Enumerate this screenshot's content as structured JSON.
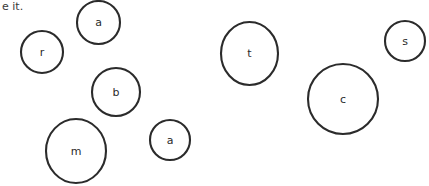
{
  "canvas": {
    "width": 429,
    "height": 186,
    "background": "#ffffff",
    "ink_color": "#2b2b2b",
    "text_color": "#3a3a3a"
  },
  "clipped_text": {
    "content": "e it.",
    "x": 2,
    "y": 2,
    "note": "partial line of text clipped by the left edge of the frame"
  },
  "bubbles": [
    {
      "id": "bubble-a-top",
      "label": "a",
      "cx": 98.5,
      "cy": 22.5,
      "rx": 21.5,
      "ry": 21.5
    },
    {
      "id": "bubble-r",
      "label": "r",
      "cx": 42,
      "cy": 52,
      "rx": 21,
      "ry": 21
    },
    {
      "id": "bubble-t",
      "label": "t",
      "cx": 249.5,
      "cy": 53.5,
      "rx": 28.5,
      "ry": 31.5
    },
    {
      "id": "bubble-s",
      "label": "s",
      "cx": 405,
      "cy": 41,
      "rx": 20,
      "ry": 20
    },
    {
      "id": "bubble-b",
      "label": "b",
      "cx": 116,
      "cy": 92,
      "rx": 24,
      "ry": 24
    },
    {
      "id": "bubble-c",
      "label": "c",
      "cx": 343,
      "cy": 99,
      "rx": 35,
      "ry": 35
    },
    {
      "id": "bubble-a-bottom",
      "label": "a",
      "cx": 170,
      "cy": 140,
      "rx": 20,
      "ry": 20
    },
    {
      "id": "bubble-m",
      "label": "m",
      "cx": 76,
      "cy": 151,
      "rx": 30,
      "ry": 32
    }
  ]
}
